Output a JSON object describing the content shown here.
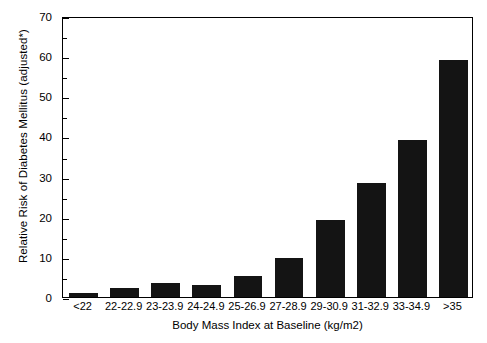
{
  "chart_data": {
    "type": "bar",
    "title": "",
    "xlabel": "Body Mass Index at Baseline (kg/m2)",
    "ylabel": "Relative Risk of Diabetes Mellitus (adjusted*)",
    "categories": [
      "<22",
      "22-22.9",
      "23-23.9",
      "24-24.9",
      "25-26.9",
      "27-28.9",
      "29-30.9",
      "31-32.9",
      "33-34.9",
      ">35"
    ],
    "values": [
      1.0,
      2.2,
      3.4,
      2.9,
      5.2,
      9.7,
      19.3,
      28.3,
      39.0,
      59.0
    ],
    "ylim": [
      0,
      70
    ],
    "yticks": [
      0,
      10,
      20,
      30,
      40,
      50,
      60,
      70
    ],
    "ytick_labels": [
      "0",
      "10",
      "20",
      "30",
      "40",
      "50",
      "60",
      "70"
    ],
    "yminor_ticks": [
      5,
      15,
      25,
      35,
      45,
      55,
      65
    ],
    "grid": false,
    "legend": null,
    "bar_color": "#141414",
    "axis_color": "#000000",
    "background": "#ffffff"
  }
}
